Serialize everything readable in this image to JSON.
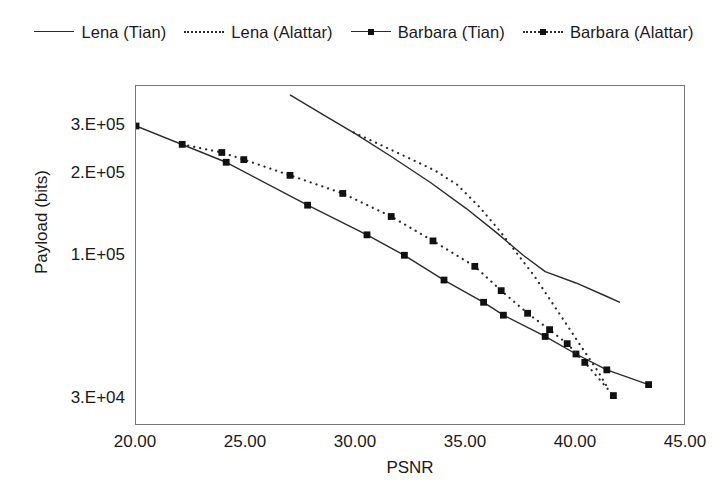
{
  "legend": {
    "position": "top",
    "entries": [
      {
        "label": "Lena (Tian)",
        "style": "solid",
        "marker": "none"
      },
      {
        "label": "Lena (Alattar)",
        "style": "dotted",
        "marker": "none"
      },
      {
        "label": "Barbara (Tian)",
        "style": "solid",
        "marker": "square"
      },
      {
        "label": "Barbara (Alattar)",
        "style": "dotted",
        "marker": "square"
      }
    ]
  },
  "axes": {
    "x": {
      "label": "PSNR",
      "ticks": [
        "20.00",
        "25.00",
        "30.00",
        "35.00",
        "40.00",
        "45.00"
      ],
      "tick_values": [
        20,
        25,
        30,
        35,
        40,
        45
      ],
      "min": 20,
      "max": 45
    },
    "y": {
      "label": "Payload (bits)",
      "ticks": [
        "3.E+05",
        "2.E+05",
        "1.E+05",
        "3.E+04"
      ],
      "tick_values": [
        300000,
        200000,
        100000,
        30000
      ],
      "scale": "log",
      "min": 24000,
      "max": 420000
    }
  },
  "colors": {
    "line": "#2b2b2b",
    "marker": "#111111",
    "frame": "#777777",
    "background": "#ffffff",
    "text": "#1a1a1a"
  },
  "chart_data": {
    "type": "line",
    "title": "",
    "xlabel": "PSNR",
    "ylabel": "Payload (bits)",
    "xlim": [
      20,
      45
    ],
    "ylim": [
      24000,
      420000
    ],
    "yscale": "log",
    "grid": false,
    "legend_position": "top",
    "series": [
      {
        "name": "Lena (Tian)",
        "style": "solid",
        "marker": "none",
        "points": [
          [
            27.0,
            390000
          ],
          [
            28.5,
            330000
          ],
          [
            30.0,
            280000
          ],
          [
            31.6,
            232000
          ],
          [
            33.4,
            186000
          ],
          [
            35.0,
            150000
          ],
          [
            36.4,
            122000
          ],
          [
            37.6,
            101000
          ],
          [
            38.6,
            88000
          ],
          [
            40.0,
            80000
          ],
          [
            41.3,
            72000
          ],
          [
            42.0,
            68000
          ]
        ]
      },
      {
        "name": "Lena (Alattar)",
        "style": "dotted",
        "marker": "none",
        "points": [
          [
            29.9,
            284000
          ],
          [
            31.2,
            254000
          ],
          [
            32.5,
            227000
          ],
          [
            33.6,
            206000
          ],
          [
            34.6,
            183000
          ],
          [
            35.6,
            152000
          ],
          [
            36.5,
            125000
          ],
          [
            37.3,
            103000
          ],
          [
            38.1,
            85000
          ],
          [
            38.9,
            68000
          ],
          [
            39.6,
            56000
          ],
          [
            40.3,
            46000
          ],
          [
            41.0,
            38000
          ],
          [
            41.4,
            33500
          ]
        ]
      },
      {
        "name": "Barbara (Tian)",
        "style": "solid",
        "marker": "square",
        "points": [
          [
            20.0,
            300000
          ],
          [
            24.1,
            221000
          ],
          [
            27.8,
            154000
          ],
          [
            30.5,
            120000
          ],
          [
            32.2,
            101000
          ],
          [
            34.0,
            82000
          ],
          [
            35.8,
            68000
          ],
          [
            36.7,
            61000
          ],
          [
            38.6,
            51000
          ],
          [
            40.0,
            44000
          ],
          [
            41.4,
            38500
          ],
          [
            43.3,
            34000
          ]
        ]
      },
      {
        "name": "Barbara (Alattar)",
        "style": "dotted",
        "marker": "square",
        "points": [
          [
            22.1,
            257000
          ],
          [
            23.9,
            240000
          ],
          [
            24.9,
            226000
          ],
          [
            27.0,
            198000
          ],
          [
            29.4,
            170000
          ],
          [
            31.6,
            140000
          ],
          [
            33.5,
            114000
          ],
          [
            35.4,
            92000
          ],
          [
            36.6,
            75000
          ],
          [
            37.8,
            62000
          ],
          [
            38.8,
            54000
          ],
          [
            39.6,
            48000
          ],
          [
            40.4,
            41000
          ],
          [
            41.7,
            31000
          ]
        ]
      }
    ]
  }
}
